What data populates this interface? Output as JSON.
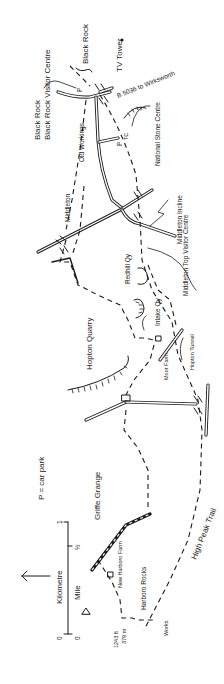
{
  "map": {
    "orientation": "rotated 90° (north arrow points left)",
    "legend": {
      "car_park_key": "P = car park",
      "scale": {
        "kilometre_label": "Kilometre",
        "mile_label": "Mile",
        "km_ticks": [
          "0",
          "1"
        ],
        "mile_ticks": [
          "0",
          "½"
        ]
      },
      "north_arrow": "north-arrow"
    },
    "places": {
      "black_rock": "Black Rock",
      "black_rock_visitor_centre": "Black Rock Visitor Centre",
      "tv_tower": "TV Tower",
      "b5036": "B 5036 to Wirksworth",
      "old_workings": "Old Workings",
      "national_stone_centre": "National Stone Centre",
      "middleton_incline": "Middleton Incline",
      "middleton_left": "Middleton",
      "middleton_right": "Middleton",
      "middleton_top": "Middleton Top Visitor Centre",
      "redhill_qy": "Redhill Qy",
      "intake_qy": "Intake Qy",
      "hopton_quarry": "Hopton Quarry",
      "moor_farm": "Moor Farm",
      "hopton_tunnel": "Hopton Tunnel",
      "griffe_grange": "Griffe Grange",
      "new_harboro_farm": "New Harboro Farm",
      "harboro_rocks": "Harboro Rocks",
      "spot_height_ft": "1243 ft",
      "spot_height_m": "379 m",
      "works": "Works",
      "high_peak_trail": "High Peak Trail"
    },
    "symbols": {
      "car_park": "P",
      "toilets": "TC"
    }
  }
}
